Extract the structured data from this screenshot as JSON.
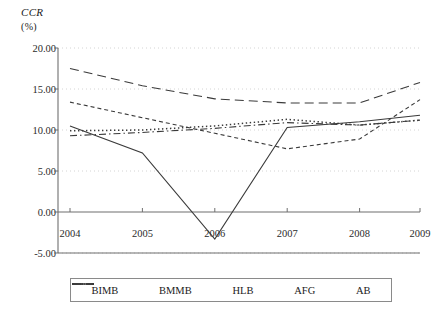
{
  "chart_data": {
    "type": "line",
    "title": "CCR",
    "subtitle": "(%)",
    "ylabel": "CCR (%)",
    "xlabel": "",
    "grid": true,
    "legend_position": "bottom",
    "ylim": [
      -5,
      20
    ],
    "ytick_labels": [
      "20.00",
      "15.00",
      "10.00",
      "5.00",
      "0.00",
      "-5.00"
    ],
    "ytick_values": [
      20,
      15,
      10,
      5,
      0,
      -5
    ],
    "categories": [
      "2004",
      "2005",
      "2006",
      "2007",
      "2008",
      "2009"
    ],
    "x": [
      2004,
      2005,
      2006,
      2007,
      2008,
      2009
    ],
    "series": [
      {
        "name": "BIMB",
        "style": "solid",
        "values": [
          10.5,
          7.2,
          -3.3,
          10.3,
          11.0,
          11.8
        ]
      },
      {
        "name": "BMMB",
        "style": "dashed",
        "values": [
          13.4,
          11.5,
          9.6,
          7.7,
          8.9,
          13.7
        ]
      },
      {
        "name": "HLB",
        "style": "longdash",
        "values": [
          17.5,
          15.4,
          13.8,
          13.3,
          13.3,
          15.8
        ]
      },
      {
        "name": "AFG",
        "style": "dotted",
        "values": [
          9.9,
          10.0,
          10.5,
          11.3,
          10.6,
          11.2
        ]
      },
      {
        "name": "AB",
        "style": "dashdot",
        "values": [
          9.3,
          9.7,
          10.2,
          10.9,
          10.6,
          11.2
        ]
      }
    ]
  },
  "legend": {
    "items": [
      {
        "label": "BIMB"
      },
      {
        "label": "BMMB"
      },
      {
        "label": "HLB"
      },
      {
        "label": "AFG"
      },
      {
        "label": "AB"
      }
    ]
  },
  "colors": {
    "line": "#3a3a3a",
    "axis": "#6f6f6f",
    "grid": "#cfcfcf",
    "text": "#1a1a1a",
    "background": "#ffffff"
  }
}
